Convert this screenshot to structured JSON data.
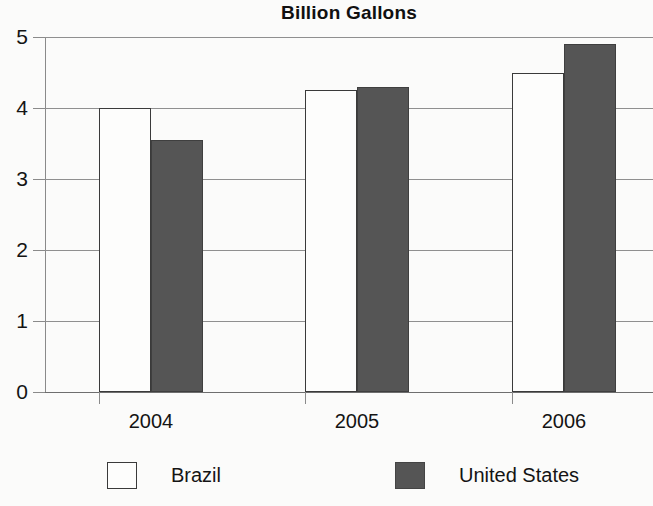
{
  "chart_data": {
    "type": "bar",
    "title": "Billion Gallons",
    "xlabel": "",
    "ylabel": "",
    "categories": [
      "2004",
      "2005",
      "2006"
    ],
    "series": [
      {
        "name": "Brazil",
        "values": [
          4.0,
          4.25,
          4.5
        ],
        "color": "#ffffff"
      },
      {
        "name": "United States",
        "values": [
          3.55,
          4.3,
          4.9
        ],
        "color": "#555555"
      }
    ],
    "ylim": [
      0,
      5
    ],
    "ytick_labels": [
      "5",
      "4",
      "3",
      "2",
      "1",
      "0"
    ],
    "ytick_values": [
      5,
      4,
      3,
      2,
      1,
      0
    ],
    "grid": true,
    "legend_position": "bottom"
  },
  "legend": {
    "items": [
      {
        "label": "Brazil",
        "swatch": "legend-swatch-brazil"
      },
      {
        "label": "United States",
        "swatch": "legend-swatch-united-states"
      }
    ]
  }
}
